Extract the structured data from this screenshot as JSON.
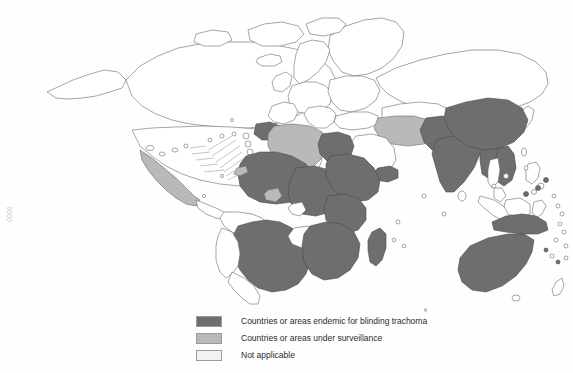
{
  "document": {
    "type": "thematic-world-map",
    "subject": "Global distribution of blinding trachoma",
    "margin_mark": "0000"
  },
  "colors": {
    "endemic": "#6e6e6e",
    "surveillance": "#b9b9b9",
    "not_applicable": "#ffffff",
    "outline": "#6a6a6a",
    "legend_text": "#2b2b2b",
    "background": "#fefefe"
  },
  "legend": {
    "items": [
      {
        "key": "endemic",
        "swatch": "#6e6e6e",
        "label": "Countries or areas endemic for blinding trachoma"
      },
      {
        "key": "surveillance",
        "swatch": "#b9b9b9",
        "label": "Countries or areas under surveillance"
      },
      {
        "key": "not_applicable",
        "swatch": "#f2f2f2",
        "label": "Not applicable"
      }
    ]
  },
  "map_data": {
    "type": "choropleth",
    "projection": "world-outline",
    "categories": [
      "endemic",
      "surveillance",
      "not_applicable"
    ],
    "regions": {
      "endemic": [
        "Brazil",
        "Mali",
        "Mauritania",
        "Niger",
        "Chad",
        "Sudan",
        "Egypt",
        "Ethiopia",
        "Eritrea",
        "Somalia",
        "Kenya",
        "Uganda",
        "Tanzania",
        "Nigeria",
        "Senegal",
        "Guinea",
        "Burkina Faso",
        "Ghana",
        "Benin",
        "Cameroon",
        "Central African Republic",
        "South Sudan",
        "Democratic Republic of the Congo",
        "Zambia",
        "Malawi",
        "Mozambique",
        "Zimbabwe",
        "Botswana",
        "Namibia",
        "South Africa",
        "Morocco",
        "Yemen",
        "Oman",
        "Pakistan",
        "Afghanistan",
        "India",
        "Nepal",
        "Myanmar",
        "China",
        "Mongolia",
        "Viet Nam",
        "Cambodia",
        "Laos",
        "Australia",
        "Papua New Guinea",
        "Madagascar"
      ],
      "surveillance": [
        "Mexico",
        "Algeria",
        "Tunisia",
        "Libya",
        "Iran",
        "Iraq",
        "Gambia",
        "Togo",
        "Cote d'Ivoire"
      ],
      "not_applicable": [
        "Canada",
        "United States of America",
        "Greenland",
        "Europe",
        "Russian Federation",
        "Japan",
        "Argentina",
        "Chile",
        "Indonesia"
      ]
    }
  }
}
